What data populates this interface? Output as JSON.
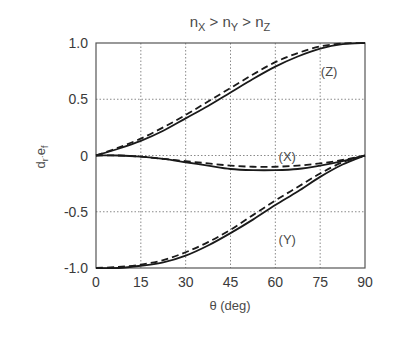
{
  "chart_data": {
    "type": "line",
    "title_parts": {
      "n1": "n",
      "s1": "X",
      "gt1": " > ",
      "n2": "n",
      "s2": "Y",
      "gt2": " > ",
      "n3": "n",
      "s3": "Z"
    },
    "xlabel": "θ (deg)",
    "ylabel": {
      "d": "d",
      "r": "r",
      "dot": "·",
      "e": "e",
      "f": "f"
    },
    "xlim": [
      0,
      90
    ],
    "ylim": [
      -1.0,
      1.0
    ],
    "xticks": [
      "0",
      "15",
      "30",
      "45",
      "60",
      "75",
      "90"
    ],
    "yticks": [
      "1.0",
      "0.5",
      "0",
      "-0.5",
      "-1.0"
    ],
    "grid": true,
    "x": [
      0,
      7.5,
      15,
      22.5,
      30,
      37.5,
      45,
      52.5,
      60,
      67.5,
      75,
      82.5,
      90
    ],
    "series": [
      {
        "name": "(Z)",
        "style": "solid",
        "values": [
          0.0,
          0.06,
          0.13,
          0.22,
          0.33,
          0.44,
          0.56,
          0.68,
          0.79,
          0.88,
          0.95,
          0.99,
          1.0
        ]
      },
      {
        "name": "(Z)",
        "style": "dashed",
        "values": [
          0.0,
          0.07,
          0.15,
          0.25,
          0.36,
          0.48,
          0.6,
          0.72,
          0.83,
          0.91,
          0.97,
          0.995,
          1.0
        ]
      },
      {
        "name": "(X)",
        "style": "solid",
        "values": [
          0.0,
          0.0,
          -0.01,
          -0.03,
          -0.06,
          -0.09,
          -0.12,
          -0.13,
          -0.13,
          -0.12,
          -0.09,
          -0.05,
          0.0
        ]
      },
      {
        "name": "(X)",
        "style": "dashed",
        "values": [
          0.0,
          0.0,
          -0.01,
          -0.03,
          -0.05,
          -0.07,
          -0.09,
          -0.1,
          -0.1,
          -0.09,
          -0.07,
          -0.04,
          0.0
        ]
      },
      {
        "name": "(Y)",
        "style": "solid",
        "values": [
          -1.0,
          -1.0,
          -0.98,
          -0.95,
          -0.89,
          -0.8,
          -0.69,
          -0.57,
          -0.44,
          -0.32,
          -0.19,
          -0.08,
          0.0
        ]
      },
      {
        "name": "(Y)",
        "style": "dashed",
        "values": [
          -1.0,
          -0.99,
          -0.97,
          -0.93,
          -0.86,
          -0.77,
          -0.66,
          -0.53,
          -0.4,
          -0.28,
          -0.16,
          -0.06,
          0.0
        ]
      }
    ],
    "annotations": [
      {
        "text": "(Z)",
        "x": 78,
        "y": 0.75
      },
      {
        "text": "(X)",
        "x": 64,
        "y": 0.0
      },
      {
        "text": "(Y)",
        "x": 64,
        "y": -0.74
      }
    ],
    "colors": {
      "line": "#1a1a1a",
      "grid": "#8a8a8a",
      "frame": "#555555"
    }
  }
}
